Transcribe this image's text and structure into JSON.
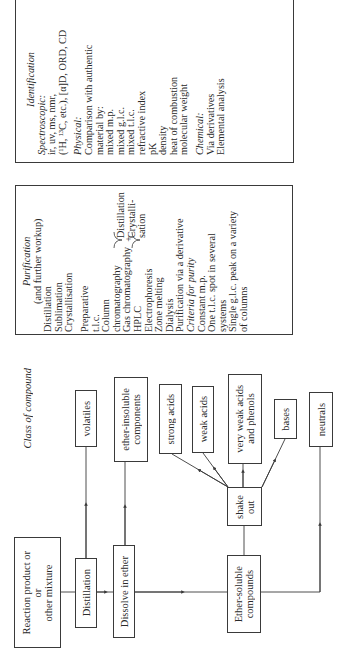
{
  "identification": {
    "title": "Identification",
    "spectroscopic_label": "Spectroscopic:",
    "spectroscopic_items": [
      "ir, uv, ms, nmr,",
      "(¹H, ¹³C, etc.), [α]D, ORD, CD"
    ],
    "physical_label": "Physical:",
    "physical_items": [
      "Comparison with authentic",
      "material by:",
      "mixed m.p.",
      "mixed g.l.c.",
      "mixed t.l.c.",
      "refractive index",
      "pK",
      "density",
      "heat of combustion",
      "molecular weight"
    ],
    "chemical_label": "Chemical:",
    "chemical_items": [
      "Via derivatives",
      "Elemental analysis"
    ]
  },
  "purification": {
    "title": "Purification",
    "subtitle": "(and further workup)",
    "items_a": [
      "Distillation",
      "Sublimation",
      "Crystallisation"
    ],
    "preparative": [
      "Preparative",
      "t.l.c."
    ],
    "column": [
      "Column",
      "chromatography"
    ],
    "brace_options": [
      "Distillation",
      "Crystalli-",
      "sation"
    ],
    "brace_plus": "+",
    "items_b": [
      "Gas chromatography",
      "HPLC",
      "Electrophoresis",
      "Zone melting",
      "Dialysis",
      "Purification via a derivative"
    ],
    "criteria_label": "Criteria for purity",
    "criteria_items": [
      "Constant m.p.",
      "One t.l.c. spot in several",
      "systems",
      "Single g.l.c. peak on a variety",
      "of columns"
    ]
  },
  "flowchart": {
    "class_label": "Class of compound",
    "reaction_product": "Reaction product or\nor\nother mixture",
    "distillation": "Distillation",
    "dissolve": "Dissolve in ether",
    "ether_soluble": "Ether-soluble\ncompounds",
    "shake_out": "shake\nout",
    "volatiles": "volatiles",
    "ether_insoluble": "ether-insoluble\ncomponents",
    "strong_acids": "strong acids",
    "weak_acids": "weak acids",
    "very_weak_acids": "very weak acids\nand phenols",
    "bases": "bases",
    "neutrals": "neutrals"
  }
}
